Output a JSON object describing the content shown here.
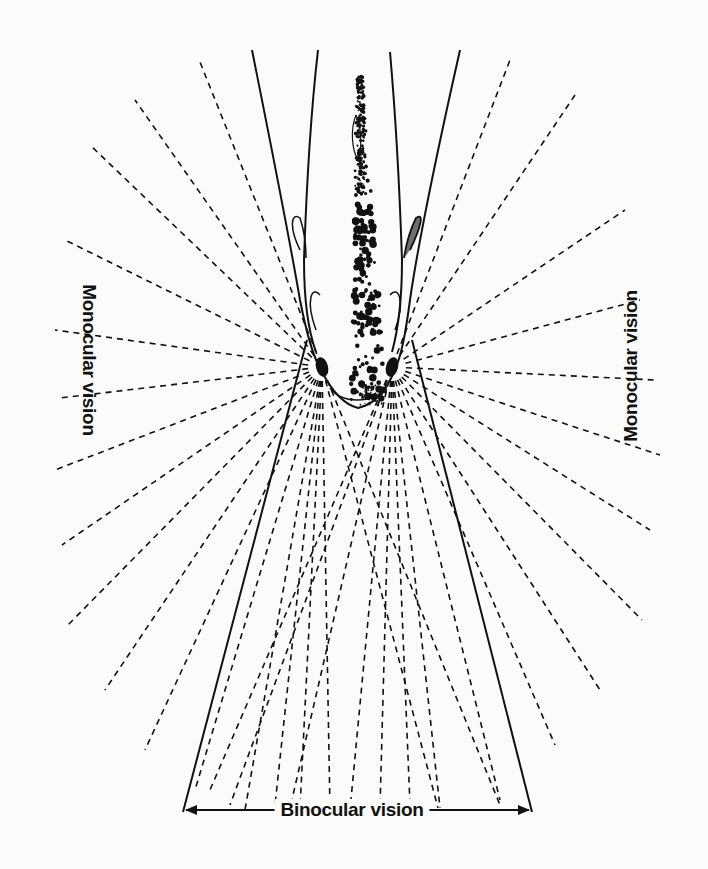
{
  "figure": {
    "labels": {
      "monocular_left": "Monocular vision",
      "monocular_right": "Monocular vision",
      "binocular": "Binocular vision"
    },
    "colors": {
      "ink": "#111111",
      "paper": "#fbfbf9"
    },
    "geometry": {
      "left_eye": [
        322,
        367
      ],
      "right_eye": [
        392,
        367
      ],
      "binocular_left_edge": {
        "from": [
          307,
          340
        ],
        "to": [
          183,
          812
        ]
      },
      "binocular_right_edge": {
        "from": [
          412,
          340
        ],
        "to": [
          532,
          812
        ]
      },
      "binocular_arrow_y": 810
    }
  }
}
